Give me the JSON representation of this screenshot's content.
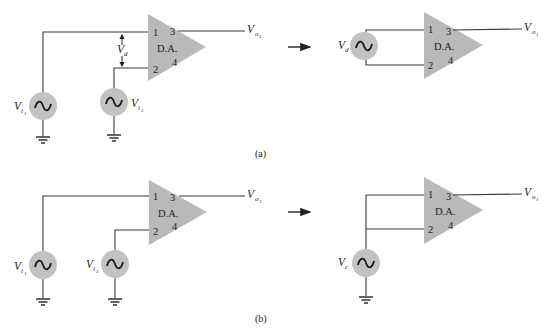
{
  "figure": {
    "colors": {
      "amplifier_fill": "#b9b9b9",
      "source_fill": "#c2c2c2",
      "wire": "#3a3a3a",
      "background": "#ffffff"
    },
    "amplifier": {
      "label": "D.A.",
      "pins": {
        "in1": "1",
        "in2": "2",
        "out": "3",
        "pin4": "4"
      }
    },
    "output_label": {
      "base": "V",
      "sub": "o",
      "subsub": "1"
    },
    "arrow_icon": "right-arrow",
    "source_icon": "ac-sine-source",
    "ground_icon": "ground",
    "panel_a": {
      "caption": "(a)",
      "left": {
        "source1": {
          "base": "V",
          "sub": "i",
          "subsub": "1"
        },
        "source2": {
          "base": "V",
          "sub": "i",
          "subsub": "2"
        },
        "diff_label": {
          "base": "V",
          "sub": "d"
        }
      },
      "right": {
        "source": {
          "base": "V",
          "sub": "d"
        }
      }
    },
    "panel_b": {
      "caption": "(b)",
      "left": {
        "source1": {
          "base": "V",
          "sub": "i",
          "subsub": "1"
        },
        "source2": {
          "base": "V",
          "sub": "i",
          "subsub": "2"
        }
      },
      "right": {
        "source": {
          "base": "V",
          "sub": "c"
        }
      }
    }
  }
}
